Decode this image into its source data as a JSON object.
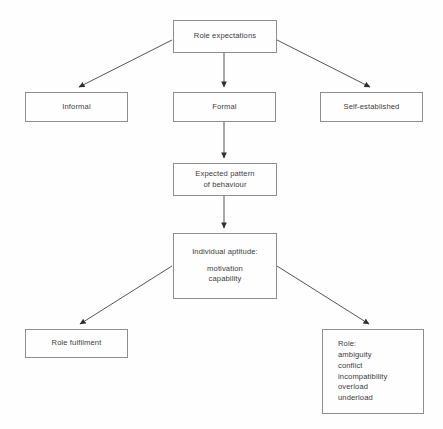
{
  "diagram": {
    "background_color": "#fefefe",
    "line_color": "#8d8d8d",
    "arrow_color": "#2f2f2f",
    "text_color": "#3b3b3b",
    "nodes": {
      "role_expectations": {
        "lines": [
          "Role expectations"
        ]
      },
      "informal": {
        "lines": [
          "Informal"
        ]
      },
      "formal": {
        "lines": [
          "Formal"
        ]
      },
      "self_established": {
        "lines": [
          "Self-established"
        ]
      },
      "expected_pattern": {
        "lines": [
          "Expected pattern",
          "of behaviour"
        ]
      },
      "individual_aptitude": {
        "lines": [
          "Individual aptitude:",
          "",
          "motivation",
          "capability"
        ]
      },
      "role_fulfilment": {
        "lines": [
          "Role fulfilment"
        ]
      },
      "role_problems": {
        "lines": [
          "Role:",
          "ambiguity",
          "conflict",
          "incompatibility",
          "overload",
          "underload"
        ]
      }
    },
    "edges": [
      {
        "from": "role_expectations",
        "to": "informal",
        "style": "diagonal-arrow"
      },
      {
        "from": "role_expectations",
        "to": "formal",
        "style": "vertical-arrow"
      },
      {
        "from": "role_expectations",
        "to": "self_established",
        "style": "diagonal-arrow"
      },
      {
        "from": "formal",
        "to": "expected_pattern",
        "style": "vertical-arrow"
      },
      {
        "from": "expected_pattern",
        "to": "individual_aptitude",
        "style": "vertical-arrow"
      },
      {
        "from": "individual_aptitude",
        "to": "role_fulfilment",
        "style": "diagonal-arrow"
      },
      {
        "from": "individual_aptitude",
        "to": "role_problems",
        "style": "diagonal-arrow"
      }
    ]
  }
}
